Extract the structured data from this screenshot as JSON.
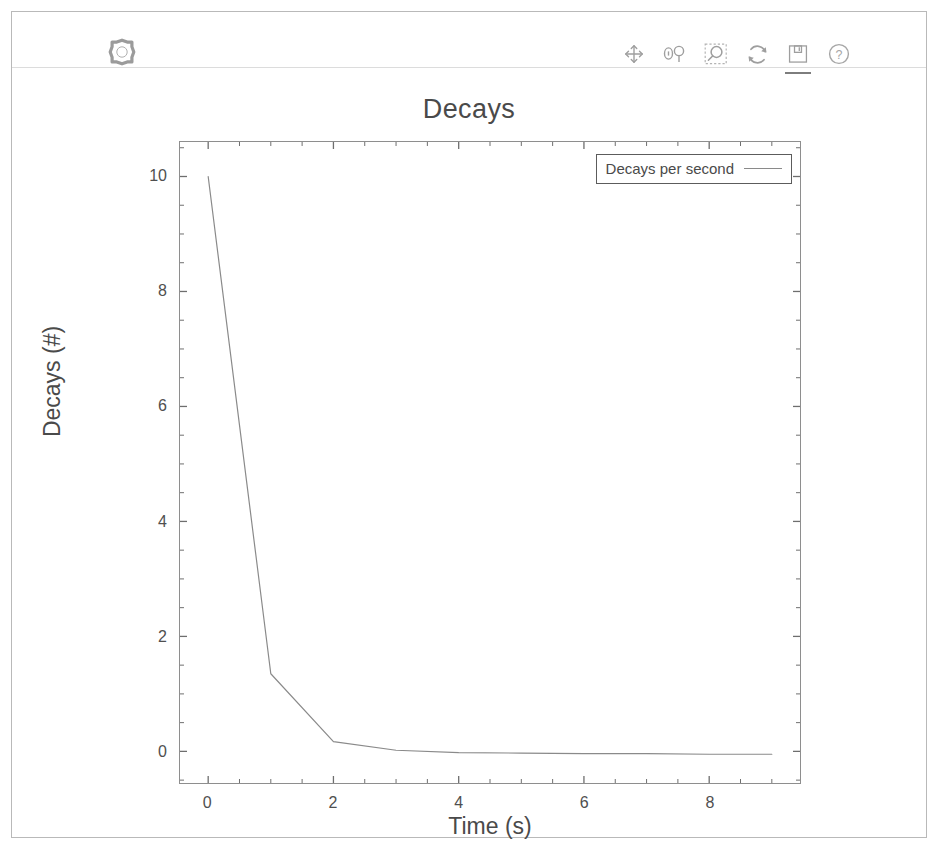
{
  "window": {
    "border_color": "#b9b9b9",
    "background": "#ffffff"
  },
  "toolbar": {
    "logo_name": "app-logo",
    "buttons": [
      {
        "name": "pan-icon",
        "label": "Pan / move",
        "active": false
      },
      {
        "name": "zoom-pair-icon",
        "label": "Zoom",
        "active": false
      },
      {
        "name": "zoom-rect-icon",
        "label": "Zoom to rectangle",
        "active": false
      },
      {
        "name": "refresh-icon",
        "label": "Reset view",
        "active": false
      },
      {
        "name": "save-icon",
        "label": "Save figure",
        "active": true
      },
      {
        "name": "help-icon",
        "label": "Help",
        "active": false
      }
    ]
  },
  "chart_data": {
    "type": "line",
    "title": "Decays",
    "xlabel": "Time (s)",
    "ylabel": "Decays (#)",
    "xlim": [
      -0.45,
      9.45
    ],
    "ylim": [
      -0.55,
      10.6
    ],
    "xticks": [
      0,
      2,
      4,
      6,
      8
    ],
    "xtick_labels": [
      "0",
      "2",
      "4",
      "6",
      "8"
    ],
    "yticks": [
      0,
      2,
      4,
      6,
      8,
      10
    ],
    "ytick_labels": [
      "0",
      "2",
      "4",
      "6",
      "8",
      "10"
    ],
    "x_minor_step": 0.5,
    "y_minor_step": 0.5,
    "grid": false,
    "legend_position": "upper right",
    "line_color": "#8a8a8a",
    "series": [
      {
        "name": "Decays per second",
        "x": [
          0,
          1,
          2,
          3,
          4,
          5,
          6,
          7,
          8,
          9
        ],
        "values": [
          10.0,
          1.35,
          0.17,
          0.02,
          -0.02,
          -0.03,
          -0.04,
          -0.04,
          -0.05,
          -0.05
        ]
      }
    ]
  }
}
